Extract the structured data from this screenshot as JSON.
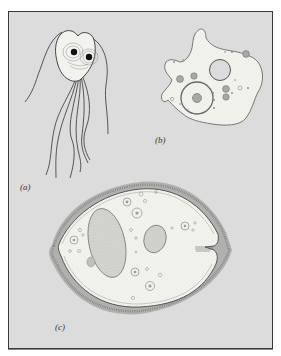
{
  "figure": {
    "panels": [
      {
        "id": "a",
        "label": "(a)",
        "subject": "flagellate-protozoan"
      },
      {
        "id": "b",
        "label": "(b)",
        "subject": "amoeba"
      },
      {
        "id": "c",
        "label": "(c)",
        "subject": "ciliate"
      }
    ],
    "colors": {
      "background": "#dcdcdc",
      "frame_border": "#3a3a3a",
      "cell_fill": "#f4f4f0",
      "outline": "#555555",
      "cilia": "#8a8a8a"
    }
  }
}
